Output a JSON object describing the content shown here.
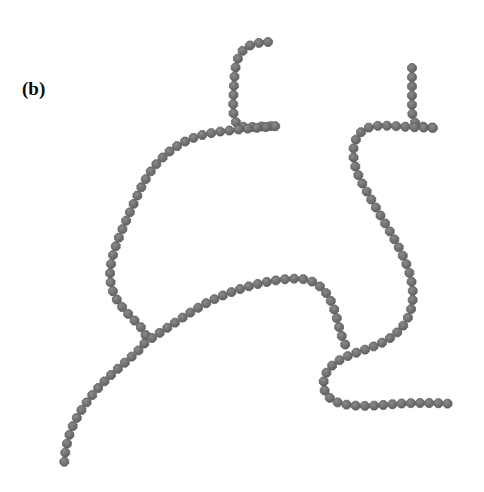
{
  "figure": {
    "width": 484,
    "height": 492,
    "background_color": "#ffffff",
    "panel_label": "(b)",
    "panel_label_color": "#0d0d0d"
  },
  "chart_data": {
    "type": "scatter",
    "title": "(b)",
    "subtitle": "",
    "xlabel": "",
    "ylabel": "",
    "xlim": [
      0,
      484
    ],
    "ylim": [
      0,
      492
    ],
    "grid": false,
    "legend_position": "none",
    "annotations": [
      "(b)"
    ],
    "marker": {
      "shape": "octagon",
      "diameter_px": 9.6,
      "fill_color": "#707070",
      "edge_color": "#5d5d5d",
      "spacing_px": 9.2
    },
    "series": [
      {
        "name": "chain-left",
        "bead_count": 84,
        "path": [
          [
            268,
            42
          ],
          [
            258,
            42
          ],
          [
            248,
            44
          ],
          [
            240,
            50
          ],
          [
            236,
            59
          ],
          [
            235,
            69
          ],
          [
            234,
            79
          ],
          [
            234,
            89
          ],
          [
            233,
            99
          ],
          [
            233,
            109
          ],
          [
            233,
            119
          ],
          [
            234,
            128
          ],
          [
            243,
            128
          ],
          [
            253,
            127
          ],
          [
            263,
            126
          ],
          [
            273,
            126
          ],
          [
            283,
            126
          ],
          [
            291,
            125
          ],
          [
            224,
            130
          ],
          [
            214,
            132
          ],
          [
            204,
            134
          ],
          [
            194,
            137
          ],
          [
            185,
            141
          ],
          [
            176,
            146
          ],
          [
            168,
            152
          ],
          [
            160,
            159
          ],
          [
            153,
            167
          ],
          [
            147,
            176
          ],
          [
            142,
            185
          ],
          [
            138,
            194
          ],
          [
            134,
            203
          ],
          [
            130,
            212
          ],
          [
            126,
            221
          ],
          [
            122,
            230
          ],
          [
            118,
            239
          ],
          [
            115,
            248
          ],
          [
            112,
            257
          ],
          [
            110,
            266
          ],
          [
            109,
            276
          ],
          [
            110,
            286
          ],
          [
            113,
            295
          ],
          [
            118,
            303
          ],
          [
            124,
            310
          ],
          [
            131,
            317
          ],
          [
            138,
            324
          ],
          [
            145,
            331
          ],
          [
            152,
            338
          ],
          [
            145,
            345
          ],
          [
            137,
            352
          ],
          [
            129,
            359
          ],
          [
            121,
            366
          ],
          [
            113,
            373
          ],
          [
            105,
            380
          ],
          [
            98,
            388
          ],
          [
            91,
            396
          ],
          [
            85,
            404
          ],
          [
            79,
            413
          ],
          [
            74,
            422
          ],
          [
            70,
            431
          ],
          [
            67,
            441
          ],
          [
            65,
            451
          ],
          [
            64,
            461
          ],
          [
            64,
            468
          ]
        ]
      },
      {
        "name": "chain-left-lower-branch",
        "bead_count": 26,
        "path": [
          [
            152,
            338
          ],
          [
            161,
            332
          ],
          [
            170,
            326
          ],
          [
            179,
            320
          ],
          [
            188,
            314
          ],
          [
            197,
            308
          ],
          [
            206,
            303
          ],
          [
            216,
            298
          ],
          [
            226,
            294
          ],
          [
            236,
            290
          ],
          [
            246,
            287
          ],
          [
            256,
            284
          ],
          [
            266,
            282
          ],
          [
            276,
            280
          ],
          [
            286,
            279
          ],
          [
            296,
            278
          ],
          [
            306,
            278
          ],
          [
            315,
            281
          ],
          [
            323,
            287
          ],
          [
            329,
            295
          ],
          [
            333,
            304
          ],
          [
            336,
            313
          ],
          [
            338,
            323
          ],
          [
            340,
            333
          ],
          [
            343,
            342
          ],
          [
            348,
            350
          ]
        ]
      },
      {
        "name": "chain-right",
        "bead_count": 62,
        "path": [
          [
            412,
            68
          ],
          [
            412,
            78
          ],
          [
            412,
            88
          ],
          [
            412,
            98
          ],
          [
            412,
            108
          ],
          [
            412,
            118
          ],
          [
            412,
            127
          ],
          [
            421,
            127
          ],
          [
            431,
            127
          ],
          [
            441,
            128
          ],
          [
            450,
            129
          ],
          [
            403,
            127
          ],
          [
            393,
            126
          ],
          [
            383,
            125
          ],
          [
            373,
            125
          ],
          [
            364,
            127
          ],
          [
            357,
            133
          ],
          [
            353,
            142
          ],
          [
            352,
            152
          ],
          [
            353,
            162
          ],
          [
            356,
            171
          ],
          [
            360,
            180
          ],
          [
            365,
            189
          ],
          [
            370,
            197
          ],
          [
            375,
            206
          ],
          [
            380,
            215
          ],
          [
            385,
            223
          ],
          [
            390,
            232
          ],
          [
            395,
            240
          ],
          [
            400,
            249
          ],
          [
            404,
            258
          ],
          [
            408,
            267
          ],
          [
            411,
            276
          ],
          [
            413,
            286
          ],
          [
            414,
            296
          ],
          [
            413,
            306
          ],
          [
            410,
            315
          ],
          [
            406,
            324
          ],
          [
            400,
            331
          ],
          [
            393,
            337
          ],
          [
            385,
            342
          ],
          [
            376,
            346
          ],
          [
            367,
            349
          ],
          [
            358,
            352
          ],
          [
            349,
            355
          ],
          [
            340,
            359
          ],
          [
            332,
            364
          ],
          [
            325,
            371
          ],
          [
            322,
            380
          ],
          [
            322,
            390
          ],
          [
            326,
            398
          ],
          [
            334,
            403
          ],
          [
            344,
            405
          ],
          [
            354,
            406
          ],
          [
            364,
            406
          ],
          [
            374,
            406
          ],
          [
            384,
            405
          ],
          [
            394,
            404
          ],
          [
            404,
            403
          ],
          [
            414,
            403
          ],
          [
            424,
            403
          ],
          [
            434,
            403
          ],
          [
            444,
            403
          ],
          [
            453,
            404
          ]
        ]
      }
    ]
  }
}
